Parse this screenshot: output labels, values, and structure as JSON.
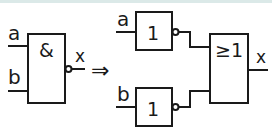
{
  "diagram": {
    "title": "",
    "left_gate": {
      "symbol": "&",
      "type": "NAND",
      "inputs": [
        "a",
        "b"
      ],
      "output": "x"
    },
    "arrow": "⇒",
    "right": {
      "not_top": {
        "symbol": "1",
        "type": "NOT",
        "input": "a"
      },
      "not_bottom": {
        "symbol": "1",
        "type": "NOT",
        "input": "b"
      },
      "or_gate": {
        "symbol": "≥1",
        "type": "OR",
        "output": "x"
      }
    }
  },
  "colors": {
    "line": "#1a1a1a",
    "background": "#ffffff",
    "top_band": "#dbe9e8"
  }
}
